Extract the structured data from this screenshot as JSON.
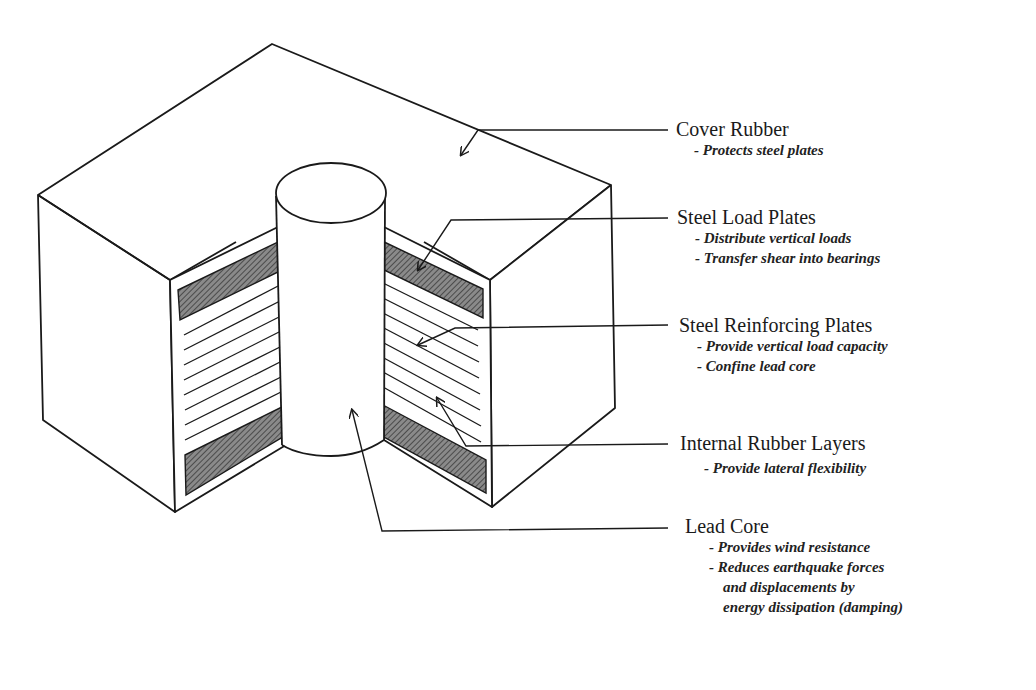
{
  "diagram": {
    "colors": {
      "line": "#1a1a1a",
      "hatch": "#5a5a5a",
      "background": "#ffffff"
    }
  },
  "labels": [
    {
      "id": "cover-rubber",
      "title": "Cover Rubber",
      "descriptions": [
        "- Protects steel plates"
      ]
    },
    {
      "id": "steel-load-plates",
      "title": "Steel Load Plates",
      "descriptions": [
        "- Distribute vertical loads",
        "- Transfer shear into bearings"
      ]
    },
    {
      "id": "steel-reinforcing-plates",
      "title": "Steel Reinforcing Plates",
      "descriptions": [
        "- Provide vertical load capacity",
        "- Confine lead core"
      ]
    },
    {
      "id": "internal-rubber-layers",
      "title": "Internal Rubber Layers",
      "descriptions": [
        "- Provide lateral flexibility"
      ]
    },
    {
      "id": "lead-core",
      "title": "Lead Core",
      "descriptions": [
        "- Provides wind resistance",
        "- Reduces earthquake forces",
        "  and displacements by",
        "  energy dissipation (damping)"
      ]
    }
  ]
}
